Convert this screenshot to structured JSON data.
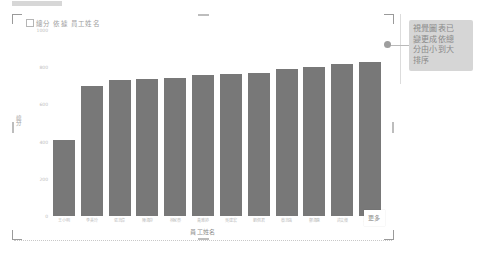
{
  "chart": {
    "title": "總分 依據 員工姓名",
    "title_icon": "chart-icon",
    "x_axis_title": "員工姓名",
    "y_axis_title": "總分"
  },
  "more_chip": {
    "label": "更多"
  },
  "callout": {
    "lines": [
      "視覺圖表已",
      "變更成依總",
      "分由小到大",
      "排序"
    ],
    "bg_color": "#d6d6d6",
    "text_color": "#8a8a8a"
  },
  "colors": {
    "bar": "#787878",
    "axis_text": "#bdbdbd",
    "title_text": "#9e9e9e",
    "frame_handle": "#9a9a9a"
  },
  "chart_data": {
    "type": "bar",
    "title": "總分 依據 員工姓名",
    "xlabel": "員工姓名",
    "ylabel": "總分",
    "categories": [
      "王小明",
      "李美玲",
      "張志偉",
      "陳淑芬",
      "林家豪",
      "黃雅婷",
      "吳建宏",
      "劉佩君",
      "蔡志強",
      "鄭淑惠",
      "許文傑",
      "周怡君"
    ],
    "values": [
      410,
      700,
      730,
      735,
      740,
      760,
      762,
      770,
      790,
      800,
      815,
      830
    ],
    "ylim": [
      0,
      1000
    ],
    "yticks": [
      0,
      200,
      400,
      600,
      800,
      1000
    ],
    "ytick_labels": [
      "0",
      "200",
      "400",
      "600",
      "800",
      "1000"
    ],
    "grid": false,
    "legend": false,
    "sorted": "ascending"
  }
}
